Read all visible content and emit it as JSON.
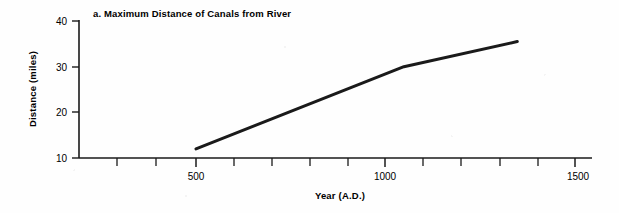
{
  "chart_data": {
    "type": "line",
    "title": "a. Maximum Distance of Canals from River",
    "xlabel": "Year (A.D.)",
    "ylabel": "Distance (miles)",
    "xlim": [
      0,
      1500
    ],
    "ylim": [
      10,
      40
    ],
    "grid": false,
    "legend": null,
    "x_ticks_major": [
      500,
      1000,
      1500
    ],
    "x_tick_labels": [
      "500",
      "1000",
      "1500"
    ],
    "x_ticks_minor": [
      100,
      200,
      300,
      400,
      600,
      700,
      800,
      900,
      1100,
      1200,
      1300,
      1400
    ],
    "y_ticks": [
      10,
      20,
      30,
      40
    ],
    "y_tick_labels": [
      "10",
      "20",
      "30",
      "40"
    ],
    "series": [
      {
        "name": "Maximum distance of canals from river",
        "x": [
          500,
          1050,
          1350
        ],
        "values": [
          12,
          30,
          35.5
        ]
      }
    ],
    "line_color": "#1a1a1a",
    "line_width": 3,
    "background_color": "#ffffff"
  },
  "figure": {
    "panel_letter": "a.",
    "caption": "a. Maximum Distance of Canals from River"
  }
}
